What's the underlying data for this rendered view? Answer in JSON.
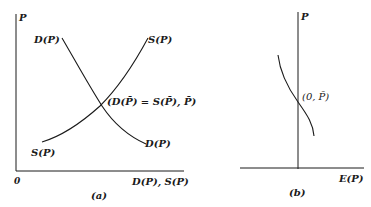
{
  "panel_a": {
    "y_axis_label": "P",
    "x_axis_label": "D(P), S(P)",
    "origin_label": "0",
    "demand_label_top": "D(P)",
    "demand_label_bottom": "D(P)",
    "supply_label_top": "S(P)",
    "supply_label_bottom": "S(P)",
    "equilibrium_label": "(D(P̄) = S(P̄), P̄)",
    "caption": "(a)"
  },
  "panel_b": {
    "y_axis_label": "P",
    "x_axis_label": "E(P)",
    "equilibrium_label": "(0, P̄)",
    "caption": "(b)"
  },
  "colors": {
    "line": "#1a1a1a",
    "background": "#ffffff"
  }
}
